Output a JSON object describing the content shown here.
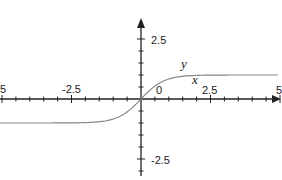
{
  "chart_data": {
    "type": "line",
    "title": "",
    "xlabel": "x",
    "ylabel": "y",
    "xlim": [
      -5,
      5
    ],
    "ylim": [
      -3,
      3
    ],
    "x_ticks": [
      "-5",
      "-2.5",
      "0",
      "2.5",
      "5"
    ],
    "y_ticks": [
      "2.5",
      "-2.5"
    ],
    "grid": false,
    "series": [
      {
        "name": "y = tanh(x)",
        "x": [
          -5,
          -2.5,
          -1.5,
          -1,
          -0.5,
          0,
          0.5,
          1,
          1.5,
          2.5,
          5
        ],
        "values": [
          -1,
          -0.99,
          -0.91,
          -0.76,
          -0.46,
          0,
          0.46,
          0.76,
          0.91,
          0.99,
          1
        ]
      }
    ],
    "color": "#888888"
  },
  "labels": {
    "x_neg5": "5",
    "x_neg25": "-2.5",
    "x_0": "0",
    "x_25": "2.5",
    "x_5": "5",
    "y_25": "2.5",
    "y_neg25": "-2.5",
    "var_y": "y",
    "var_x": "x"
  }
}
